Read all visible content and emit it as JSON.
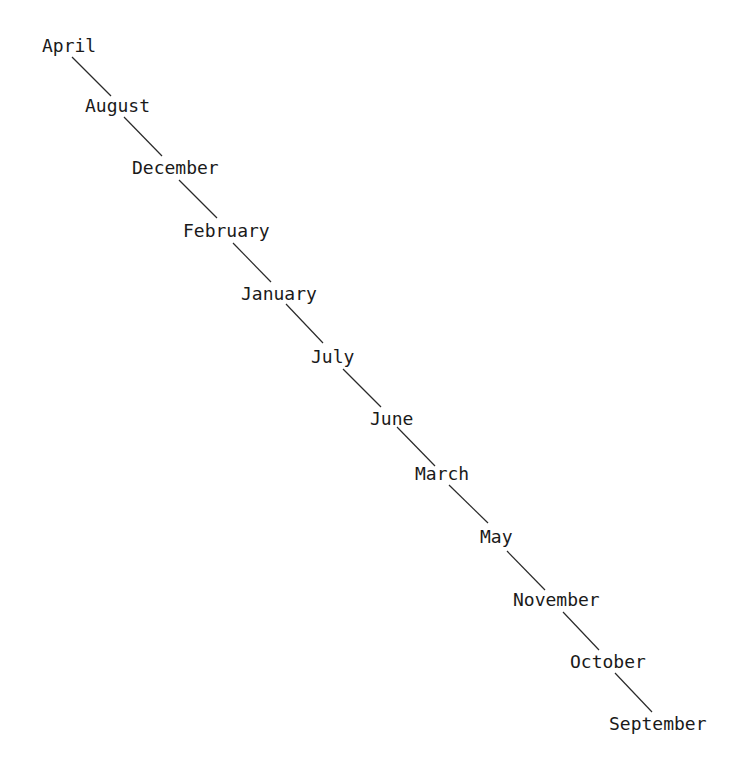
{
  "diagram": {
    "type": "chain",
    "nodes": [
      {
        "label": "April"
      },
      {
        "label": "August"
      },
      {
        "label": "December"
      },
      {
        "label": "February"
      },
      {
        "label": "January"
      },
      {
        "label": "July"
      },
      {
        "label": "June"
      },
      {
        "label": "March"
      },
      {
        "label": "May"
      },
      {
        "label": "November"
      },
      {
        "label": "October"
      },
      {
        "label": "September"
      }
    ],
    "edges": [
      {
        "from": "April",
        "to": "August"
      },
      {
        "from": "August",
        "to": "December"
      },
      {
        "from": "December",
        "to": "February"
      },
      {
        "from": "February",
        "to": "January"
      },
      {
        "from": "January",
        "to": "July"
      },
      {
        "from": "July",
        "to": "June"
      },
      {
        "from": "June",
        "to": "March"
      },
      {
        "from": "March",
        "to": "May"
      },
      {
        "from": "May",
        "to": "November"
      },
      {
        "from": "November",
        "to": "October"
      },
      {
        "from": "October",
        "to": "September"
      }
    ]
  }
}
